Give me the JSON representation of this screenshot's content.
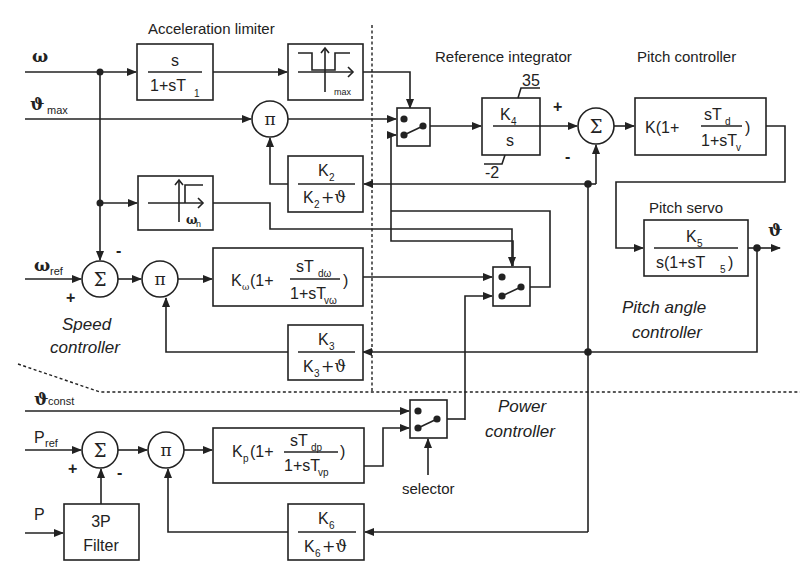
{
  "section_labels": {
    "acceleration_limiter": "Acceleration limiter",
    "reference_integrator": "Reference integrator",
    "pitch_controller": "Pitch controller",
    "pitch_servo": "Pitch servo",
    "speed_controller_1": "Speed",
    "speed_controller_2": "controller",
    "pitch_angle_controller_1": "Pitch angle",
    "pitch_angle_controller_2": "controller",
    "power_controller_1": "Power",
    "power_controller_2": "controller",
    "selector": "selector"
  },
  "inputs": {
    "omega": "ω",
    "theta_max": "ϑ",
    "theta_max_sub": "max",
    "omega_ref": "ω",
    "omega_ref_sub": "ref",
    "theta_const": "ϑ",
    "theta_const_sub": "const",
    "p_ref": "P",
    "p_ref_sub": "ref",
    "p": "P"
  },
  "outputs": {
    "theta": "ϑ"
  },
  "blocks": {
    "highpass": {
      "num": "s",
      "den": "1+sT",
      "den_sub": "1"
    },
    "acc_limiter": {
      "sub": "max"
    },
    "omega_n_limiter": {
      "label": "ω",
      "label_sub": "n"
    },
    "k2": {
      "num": "K",
      "num_sub": "2",
      "den": "K",
      "den_sub": "2",
      "den_tail": "+ϑ"
    },
    "k3": {
      "num": "K",
      "num_sub": "3",
      "den": "K",
      "den_sub": "3",
      "den_tail": "+ϑ"
    },
    "k6": {
      "num": "K",
      "num_sub": "6",
      "den": "K",
      "den_sub": "6",
      "den_tail": "+ϑ"
    },
    "integrator": {
      "num": "K",
      "num_sub": "4",
      "den": "s",
      "upper_limit": "35",
      "lower_limit": "-2"
    },
    "pitch_ctrl": {
      "prefix": "K(1+",
      "num": "sT",
      "num_sub": "d",
      "den": "1+sT",
      "den_sub": "v",
      "suffix": ")"
    },
    "pitch_servo": {
      "num": "K",
      "num_sub": "5",
      "den": "s(1+sT",
      "den_sub": "5",
      "den_tail": ")"
    },
    "speed_ctrl": {
      "prefix": "K",
      "prefix_sub": "ω",
      "prefix_tail": "(1+",
      "num": "sT",
      "num_sub": "dω",
      "den": "1+sT",
      "den_sub": "vω",
      "suffix": ")"
    },
    "power_ctrl": {
      "prefix": "K",
      "prefix_sub": "p",
      "prefix_tail": "(1+",
      "num": "sT",
      "num_sub": "dp",
      "den": "1+sT",
      "den_sub": "vp",
      "suffix": ")"
    },
    "filter": {
      "line1": "3P",
      "line2": "Filter"
    }
  },
  "operators": {
    "sum": "Σ",
    "mult": "π",
    "plus": "+",
    "minus": "-"
  }
}
